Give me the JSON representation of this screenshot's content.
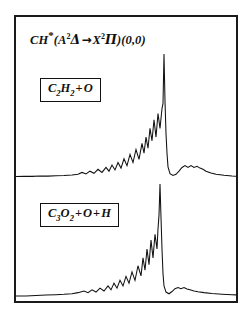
{
  "figure": {
    "kind": "emission-spectrum-figure",
    "frame_color": "#1a1a1a",
    "background_color": "#ffffff",
    "trace_color": "#111111",
    "title": {
      "species": "CH",
      "excited_marker": "*",
      "transition_open": "(",
      "upper_state_letter": "A",
      "upper_state_multiplicity": "2",
      "upper_state_symbol": "Δ",
      "arrow": "→",
      "lower_state_letter": "X",
      "lower_state_multiplicity": "2",
      "lower_state_symbol": "Π",
      "transition_close": ")",
      "band": "(0,0)",
      "full_text": "CH*(A2Δ → X2Π)(0,0)"
    },
    "panels": [
      {
        "id": "top",
        "reaction": {
          "reactant_a": "C",
          "reactant_a_sub": "2",
          "reactant_a_tail": "H",
          "reactant_a_tail_sub": "2",
          "operator": "+",
          "reactant_b": "O",
          "full_text": "C2H2 + O"
        }
      },
      {
        "id": "bottom",
        "reaction": {
          "reactant_a": "C",
          "reactant_a_sub": "3",
          "reactant_a_tail": "O",
          "reactant_a_tail_sub": "2",
          "operator": "+",
          "reactant_b": "O",
          "operator2": "+",
          "reactant_c": "H",
          "full_text": "C3O2 + O + H"
        }
      }
    ]
  },
  "chart_data": {
    "type": "line",
    "xlabel": "",
    "ylabel": "",
    "grid": false,
    "legend": "none",
    "axis_shown": false,
    "xlim": [
      0,
      220
    ],
    "ylim": [
      0,
      1
    ],
    "series": [
      {
        "name": "C2H2 + O",
        "panel": "top",
        "baseline_y": 0.0,
        "peak_x": 148,
        "peak_y": 1.0,
        "x": [
          0,
          8,
          16,
          24,
          32,
          40,
          48,
          56,
          62,
          66,
          70,
          74,
          78,
          82,
          86,
          90,
          93,
          96,
          99,
          102,
          105,
          108,
          111,
          114,
          117,
          120,
          123,
          126,
          128,
          130,
          132,
          134,
          136,
          138,
          140,
          142,
          144,
          146,
          147,
          148,
          149,
          150,
          151,
          152,
          154,
          157,
          160,
          163,
          166,
          169,
          172,
          175,
          178,
          181,
          184,
          187,
          190,
          195,
          200,
          208,
          216,
          220
        ],
        "y": [
          0.012,
          0.014,
          0.013,
          0.016,
          0.015,
          0.018,
          0.02,
          0.024,
          0.03,
          0.045,
          0.032,
          0.055,
          0.038,
          0.07,
          0.045,
          0.085,
          0.055,
          0.105,
          0.065,
          0.125,
          0.08,
          0.155,
          0.1,
          0.19,
          0.125,
          0.23,
          0.15,
          0.28,
          0.2,
          0.33,
          0.24,
          0.4,
          0.3,
          0.47,
          0.33,
          0.52,
          0.4,
          0.56,
          0.6,
          1.0,
          0.62,
          0.36,
          0.2,
          0.09,
          0.035,
          0.02,
          0.03,
          0.055,
          0.085,
          0.1,
          0.085,
          0.1,
          0.085,
          0.095,
          0.08,
          0.07,
          0.055,
          0.04,
          0.03,
          0.022,
          0.016,
          0.014
        ]
      },
      {
        "name": "C3O2 + O + H",
        "panel": "bottom",
        "baseline_y": 0.0,
        "peak_x": 144,
        "peak_y": 1.0,
        "x": [
          0,
          10,
          20,
          30,
          40,
          48,
          56,
          62,
          68,
          72,
          76,
          80,
          84,
          88,
          92,
          95,
          98,
          101,
          104,
          107,
          110,
          113,
          116,
          119,
          122,
          125,
          127,
          129,
          131,
          133,
          135,
          137,
          139,
          141,
          142,
          143,
          144,
          145,
          146,
          147,
          148,
          150,
          153,
          156,
          159,
          162,
          165,
          168,
          171,
          174,
          178,
          182,
          188,
          196,
          206,
          216,
          220
        ],
        "y": [
          0.0,
          0.0,
          0.005,
          0.008,
          0.012,
          0.015,
          0.02,
          0.03,
          0.045,
          0.03,
          0.055,
          0.035,
          0.07,
          0.045,
          0.09,
          0.055,
          0.115,
          0.07,
          0.14,
          0.09,
          0.175,
          0.115,
          0.215,
          0.14,
          0.27,
          0.18,
          0.34,
          0.23,
          0.42,
          0.28,
          0.5,
          0.34,
          0.55,
          0.42,
          0.6,
          0.72,
          1.0,
          0.7,
          0.42,
          0.2,
          0.09,
          0.035,
          0.02,
          0.04,
          0.065,
          0.075,
          0.065,
          0.075,
          0.062,
          0.055,
          0.045,
          0.038,
          0.03,
          0.022,
          0.016,
          0.012,
          0.01
        ]
      }
    ]
  }
}
